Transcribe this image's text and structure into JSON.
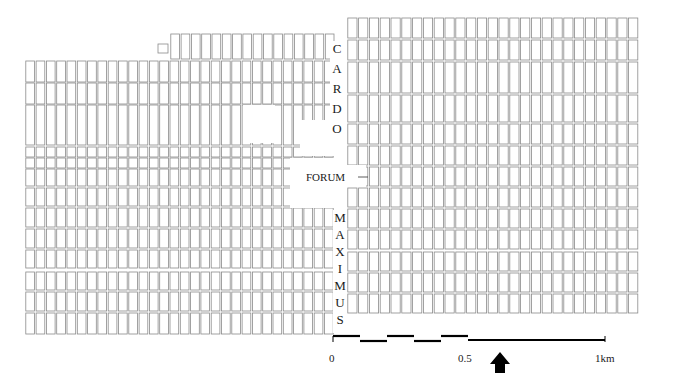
{
  "map": {
    "labels": {
      "cardo": [
        "C",
        "A",
        "R",
        "D",
        "O"
      ],
      "forum": "FORUM",
      "maximus": [
        "M",
        "A",
        "X",
        "I",
        "M",
        "U",
        "S"
      ]
    },
    "scale_bar": {
      "ticks": [
        {
          "label": "0",
          "x": 333
        },
        {
          "label": "0.5",
          "x": 468
        },
        {
          "label": "1km",
          "x": 605
        }
      ]
    },
    "north_arrow": "north-arrow",
    "colors": {
      "plot_stroke": "#8a8a8a",
      "ink": "#000000",
      "background": "#ffffff"
    },
    "west_block": {
      "x_start": 25,
      "x_end": 335,
      "col_width": 10.3,
      "rows": [
        [
          61,
          82
        ],
        [
          83,
          104
        ],
        [
          105,
          145
        ],
        [
          147,
          157
        ],
        [
          158,
          168
        ],
        [
          169,
          186
        ],
        [
          188,
          206
        ],
        [
          208,
          227
        ],
        [
          229,
          248
        ],
        [
          250,
          268
        ],
        [
          272,
          290
        ],
        [
          292,
          311
        ],
        [
          313,
          334
        ]
      ],
      "top_extension": {
        "x_start": 170,
        "rows": [
          [
            34,
            59
          ]
        ]
      },
      "small_plot": [
        158,
        44,
        10,
        9
      ]
    },
    "east_block": {
      "x_start": 347,
      "x_end": 648,
      "col_width": 10.8,
      "rows": [
        [
          18,
          38
        ],
        [
          40,
          60
        ],
        [
          62,
          93
        ],
        [
          95,
          122
        ],
        [
          124,
          144
        ],
        [
          146,
          165
        ],
        [
          167,
          186
        ],
        [
          188,
          207
        ],
        [
          209,
          228
        ],
        [
          230,
          249
        ],
        [
          252,
          271
        ],
        [
          273,
          292
        ],
        [
          294,
          313
        ]
      ]
    },
    "voids": [
      [
        243,
        105,
        32,
        38
      ],
      [
        290,
        158,
        50,
        50
      ],
      [
        300,
        120,
        40,
        36
      ]
    ]
  }
}
